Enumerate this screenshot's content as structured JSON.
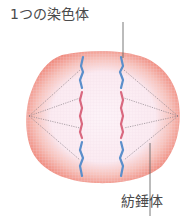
{
  "labels": {
    "chromosome": "1つの染色体",
    "spindle": "紡錘体"
  },
  "diagram": {
    "parts": [
      "cell-membrane",
      "left-pole",
      "right-pole",
      "left-chromosome",
      "right-chromosome",
      "spindle-fibers"
    ]
  },
  "colors": {
    "membrane": "#f08a7e",
    "cytoplasm": "#fbeef4",
    "chromosome_blue": "#5b8fcb",
    "chromosome_pink": "#d9687f",
    "fiber": "#8a7f86",
    "leader_line": "#555555"
  }
}
